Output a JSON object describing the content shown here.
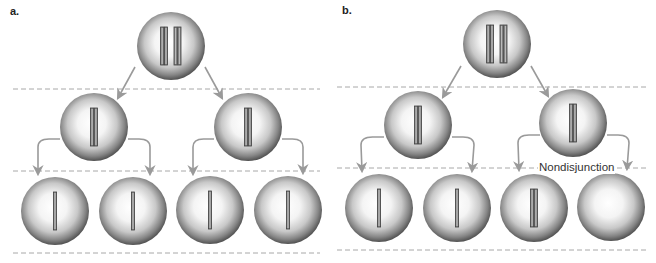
{
  "figure": {
    "colors": {
      "background": "#ffffff",
      "cell_edge": "#4a4a4a",
      "cell_center": "#ffffff",
      "chromosome_fill": "#8c8c8c",
      "chromosome_edge": "#3c3c3c",
      "arrow": "#9a9a9a",
      "dashed_line": "#a8a8a8"
    },
    "panels": [
      {
        "id": "a",
        "label": "a.",
        "label_pos": [
          10,
          11
        ],
        "dashed_lines": [
          {
            "x1": 13,
            "x2": 320,
            "y": 89
          },
          {
            "x1": 13,
            "x2": 320,
            "y": 171
          },
          {
            "x1": 13,
            "x2": 320,
            "y": 253
          }
        ],
        "cells": [
          {
            "name": "parent-cell",
            "cx": 171,
            "cy": 46,
            "r": 34,
            "chromosomes": 2,
            "chromatids": 2
          },
          {
            "name": "meiosis-i-cell-left",
            "cx": 94,
            "cy": 127,
            "r": 34,
            "chromosomes": 1,
            "chromatids": 2
          },
          {
            "name": "meiosis-i-cell-right",
            "cx": 248,
            "cy": 127,
            "r": 34,
            "chromosomes": 1,
            "chromatids": 2
          },
          {
            "name": "gamete-1",
            "cx": 55,
            "cy": 211,
            "r": 34,
            "chromosomes": 1,
            "chromatids": 1
          },
          {
            "name": "gamete-2",
            "cx": 133,
            "cy": 211,
            "r": 34,
            "chromosomes": 1,
            "chromatids": 1
          },
          {
            "name": "gamete-3",
            "cx": 210,
            "cy": 210,
            "r": 34,
            "chromosomes": 1,
            "chromatids": 1
          },
          {
            "name": "gamete-4",
            "cx": 288,
            "cy": 210,
            "r": 34,
            "chromosomes": 1,
            "chromatids": 1
          }
        ],
        "arrows": [
          {
            "type": "straight",
            "from": [
              135,
              67
            ],
            "to": [
              118,
              98
            ]
          },
          {
            "type": "straight",
            "from": [
              205,
              67
            ],
            "to": [
              222,
              98
            ]
          },
          {
            "type": "curved",
            "from": [
              60,
              139
            ],
            "corner": [
              38,
              139
            ],
            "to": [
              38,
              174
            ]
          },
          {
            "type": "curved",
            "from": [
              128,
              139
            ],
            "corner": [
              150,
              139
            ],
            "to": [
              150,
              174
            ]
          },
          {
            "type": "curved",
            "from": [
              214,
              139
            ],
            "corner": [
              193,
              139
            ],
            "to": [
              193,
              174
            ]
          },
          {
            "type": "curved",
            "from": [
              282,
              139
            ],
            "corner": [
              303,
              139
            ],
            "to": [
              303,
              173
            ]
          }
        ]
      },
      {
        "id": "b",
        "label": "b.",
        "label_pos": [
          342,
          10
        ],
        "dashed_lines": [
          {
            "x1": 337,
            "x2": 648,
            "y": 87
          },
          {
            "x1": 337,
            "x2": 648,
            "y": 168
          },
          {
            "x1": 337,
            "x2": 648,
            "y": 250
          }
        ],
        "cells": [
          {
            "name": "parent-cell",
            "cx": 497,
            "cy": 44,
            "r": 34,
            "chromosomes": 2,
            "chromatids": 2
          },
          {
            "name": "meiosis-i-cell-left",
            "cx": 418,
            "cy": 125,
            "r": 34,
            "chromosomes": 1,
            "chromatids": 2
          },
          {
            "name": "meiosis-i-cell-right",
            "cx": 573,
            "cy": 123,
            "r": 34,
            "chromosomes": 1,
            "chromatids": 2
          },
          {
            "name": "gamete-1",
            "cx": 379,
            "cy": 208,
            "r": 34,
            "chromosomes": 1,
            "chromatids": 1
          },
          {
            "name": "gamete-2",
            "cx": 457,
            "cy": 208,
            "r": 34,
            "chromosomes": 1,
            "chromatids": 1
          },
          {
            "name": "gamete-3-nondisjunction-extra",
            "cx": 534,
            "cy": 208,
            "r": 34,
            "chromosomes": 1,
            "chromatids": 2,
            "tight": true
          },
          {
            "name": "gamete-4-nondisjunction-empty",
            "cx": 611,
            "cy": 207,
            "r": 34,
            "chromosomes": 0,
            "chromatids": 0
          }
        ],
        "arrows": [
          {
            "type": "straight",
            "from": [
              461,
              66
            ],
            "to": [
              443,
              97
            ]
          },
          {
            "type": "straight",
            "from": [
              531,
              66
            ],
            "to": [
              548,
              96
            ]
          },
          {
            "type": "curved",
            "from": [
              384,
              137
            ],
            "corner": [
              361,
              137
            ],
            "to": [
              362,
              171
            ]
          },
          {
            "type": "curved",
            "from": [
              452,
              137
            ],
            "corner": [
              474,
              137
            ],
            "to": [
              472,
              171
            ]
          },
          {
            "type": "curved",
            "from": [
              540,
              135
            ],
            "corner": [
              518,
              135
            ],
            "to": [
              519,
              170
            ]
          },
          {
            "type": "curved",
            "from": [
              607,
              135
            ],
            "corner": [
              629,
              135
            ],
            "to": [
              627,
              169
            ]
          }
        ],
        "annotation": {
          "text": "Nondisjunction",
          "x": 538,
          "y": 161
        }
      }
    ]
  }
}
